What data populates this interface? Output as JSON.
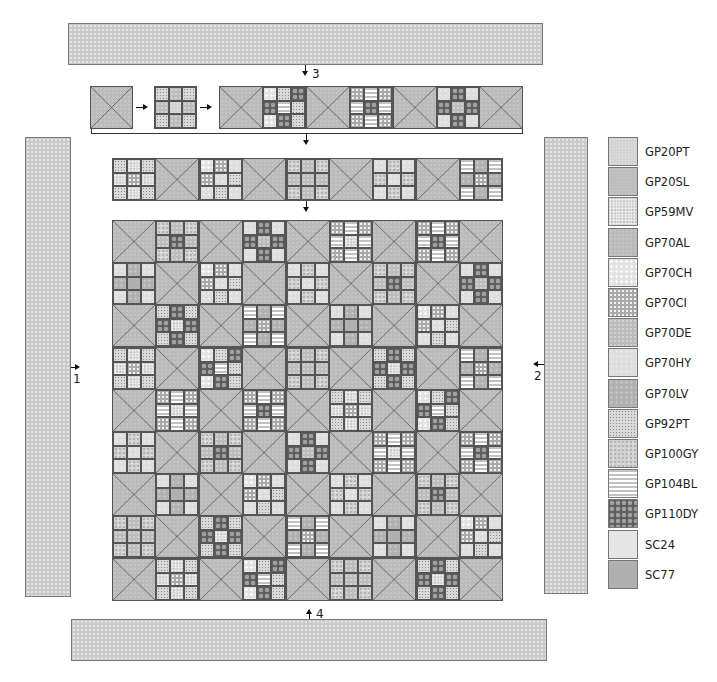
{
  "diagram": {
    "steps": [
      {
        "label": "1",
        "target": "left-border"
      },
      {
        "label": "2",
        "target": "right-border"
      },
      {
        "label": "3",
        "target": "top-border"
      },
      {
        "label": "4",
        "target": "bottom-border"
      }
    ],
    "borders": {
      "top": {
        "fabric": "GP70AL",
        "step": "3"
      },
      "bottom": {
        "fabric": "GP70AL",
        "step": "4"
      },
      "left": {
        "fabric": "GP70AL",
        "step": "1"
      },
      "right": {
        "fabric": "GP70AL",
        "step": "2"
      }
    },
    "assembly_row_example": {
      "x_block": "x-block",
      "nine_patch": [
        "GP92PT",
        "GP70DE",
        "GP92PT",
        "GP70DE",
        "GP20PT",
        "GP70DE",
        "GP92PT",
        "GP70DE",
        "GP92PT"
      ],
      "row_strip": [
        "X",
        "NP-cheddar",
        "X",
        "NP-stripe",
        "X",
        "NP-dy",
        "X"
      ]
    },
    "grid": {
      "rows": 9,
      "cols": 9,
      "pattern": "alternating x-blocks and nine-patch blocks"
    }
  },
  "legend": {
    "items": [
      {
        "code": "GP20PT",
        "label": "GP20PT"
      },
      {
        "code": "GP20SL",
        "label": "GP20SL"
      },
      {
        "code": "GP59MV",
        "label": "GP59MV"
      },
      {
        "code": "GP70AL",
        "label": "GP70AL"
      },
      {
        "code": "GP70CH",
        "label": "GP70CH"
      },
      {
        "code": "GP70CI",
        "label": "GP70CI"
      },
      {
        "code": "GP70DE",
        "label": "GP70DE"
      },
      {
        "code": "GP70HY",
        "label": "GP70HY"
      },
      {
        "code": "GP70LV",
        "label": "GP70LV"
      },
      {
        "code": "GP92PT",
        "label": "GP92PT"
      },
      {
        "code": "GP100GY",
        "label": "GP100GY"
      },
      {
        "code": "GP104BL",
        "label": "GP104BL"
      },
      {
        "code": "GP110DY",
        "label": "GP110DY"
      },
      {
        "code": "SC24",
        "label": "SC24"
      },
      {
        "code": "SC77",
        "label": "SC77"
      }
    ]
  },
  "colors": {
    "outline": "#555555",
    "arrow": "#111111",
    "border_fabric": "#c9c9c9"
  }
}
